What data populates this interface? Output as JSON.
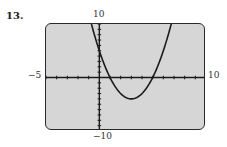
{
  "problem": {
    "number": "13."
  },
  "chart_data": {
    "type": "line",
    "title": "",
    "xlabel": "",
    "ylabel": "",
    "xlim": [
      -5,
      10
    ],
    "ylim": [
      -10,
      10
    ],
    "x_tick_step": 1,
    "y_tick_step": 1,
    "window_labels": {
      "xmin": "−5",
      "xmax": "10",
      "ymin": "−10",
      "ymax": "10"
    },
    "grid": false,
    "series": [
      {
        "name": "y = x² − 6x + 5",
        "function": "x^2 - 6x + 5",
        "approximate_fit": true,
        "vertex": [
          3,
          -4
        ],
        "x_intercepts": [
          1,
          5
        ],
        "y_intercept": 5
      }
    ],
    "style": {
      "background": "#d6d6d6",
      "curve_color": "#1a1a1a",
      "axis_color": "#1a1a1a"
    }
  }
}
